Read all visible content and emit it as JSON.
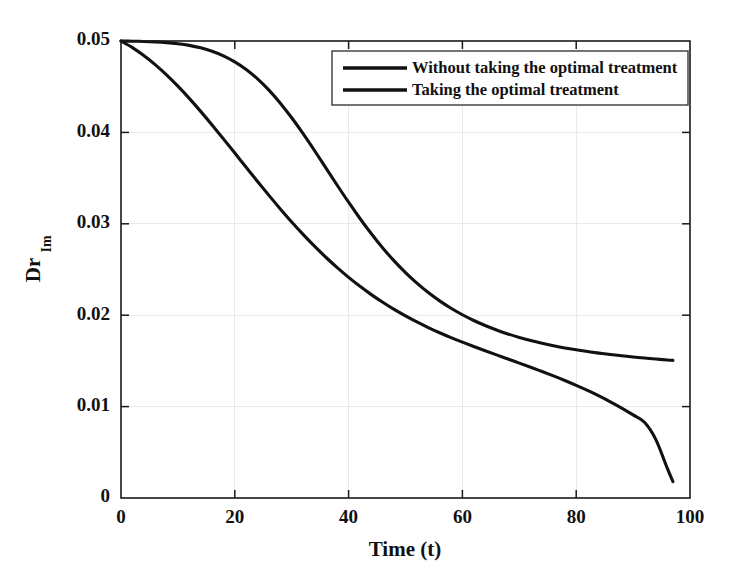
{
  "chart_data": {
    "type": "line",
    "title": "",
    "xlabel": "Time (t)",
    "ylabel": "Dr",
    "ylabel_subscript": "Im",
    "xlim": [
      0,
      100
    ],
    "ylim": [
      0,
      0.05
    ],
    "grid": true,
    "legend_position": "top-right",
    "xticks": [
      0,
      20,
      40,
      60,
      80,
      100
    ],
    "xtick_labels": [
      "0",
      "20",
      "40",
      "60",
      "80",
      "100"
    ],
    "yticks": [
      0,
      0.01,
      0.02,
      0.03,
      0.04,
      0.05
    ],
    "ytick_labels": [
      "0",
      "0.01",
      "0.02",
      "0.03",
      "0.04",
      "0.05"
    ],
    "x": [
      0,
      2,
      4,
      6,
      8,
      10,
      12,
      14,
      16,
      18,
      20,
      22,
      24,
      26,
      28,
      30,
      32,
      34,
      36,
      38,
      40,
      42,
      44,
      46,
      48,
      50,
      52,
      54,
      56,
      58,
      60,
      62,
      64,
      66,
      68,
      70,
      72,
      74,
      76,
      78,
      80,
      82,
      84,
      86,
      88,
      90,
      92,
      94,
      96,
      97
    ],
    "series": [
      {
        "name": "Without taking the optimal treatment",
        "color": "#111111",
        "values": [
          0.05,
          0.04998,
          0.04995,
          0.0499,
          0.04982,
          0.0497,
          0.04952,
          0.04925,
          0.04888,
          0.04838,
          0.04772,
          0.04688,
          0.04585,
          0.04462,
          0.0432,
          0.0416,
          0.03986,
          0.03802,
          0.03612,
          0.03422,
          0.03236,
          0.03058,
          0.02891,
          0.02736,
          0.02594,
          0.02466,
          0.02351,
          0.02248,
          0.02157,
          0.02076,
          0.02005,
          0.01942,
          0.01887,
          0.01838,
          0.01795,
          0.01757,
          0.01723,
          0.01693,
          0.01666,
          0.01642,
          0.01621,
          0.01602,
          0.01585,
          0.0157,
          0.01556,
          0.01543,
          0.01531,
          0.0152,
          0.0151,
          0.01506
        ]
      },
      {
        "name": "Taking the optimal treatment",
        "color": "#111111",
        "values": [
          0.05,
          0.04928,
          0.04842,
          0.04742,
          0.0463,
          0.04506,
          0.04372,
          0.0423,
          0.04082,
          0.03929,
          0.03774,
          0.03618,
          0.03463,
          0.03311,
          0.03163,
          0.0302,
          0.02884,
          0.02755,
          0.02634,
          0.0252,
          0.02414,
          0.02316,
          0.02225,
          0.02141,
          0.02063,
          0.01992,
          0.01926,
          0.01865,
          0.01808,
          0.01755,
          0.01705,
          0.01657,
          0.01611,
          0.01566,
          0.01521,
          0.01476,
          0.01431,
          0.01384,
          0.01336,
          0.01286,
          0.01233,
          0.01177,
          0.01117,
          0.01053,
          0.00984,
          0.00909,
          0.00828,
          0.00639,
          0.00326,
          0.0018
        ]
      }
    ],
    "crossing_point": {
      "x": 62,
      "y": 0.0171
    }
  },
  "legend": {
    "entries": [
      {
        "label": "Without taking the optimal treatment"
      },
      {
        "label": "Taking the optimal treatment"
      }
    ]
  }
}
